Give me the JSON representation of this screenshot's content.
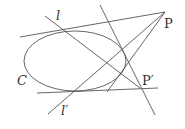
{
  "diagram": {
    "type": "projective-geometry-conic",
    "stroke_color": "#555555",
    "conic": {
      "label": "C",
      "cx": 75,
      "cy": 61,
      "rx": 51,
      "ry": 30
    },
    "points": [
      {
        "id": "P",
        "label": "P",
        "x": 165,
        "y": 12
      },
      {
        "id": "P_prime",
        "label": "P'",
        "x": 140,
        "y": 88
      }
    ],
    "lines": [
      {
        "id": "top-tangent",
        "x1": 20,
        "y1": 37,
        "x2": 165,
        "y2": 12
      },
      {
        "id": "bottom-tangent",
        "x1": 37,
        "y1": 93,
        "x2": 158,
        "y2": 88
      },
      {
        "id": "l",
        "label": "l",
        "x1": 45,
        "y1": 16,
        "x2": 140,
        "y2": 88
      },
      {
        "id": "l_prime",
        "label": "l'",
        "x1": 48,
        "y1": 114,
        "x2": 165,
        "y2": 12
      },
      {
        "id": "steep-line",
        "x1": 100,
        "y1": 5,
        "x2": 155,
        "y2": 115
      },
      {
        "id": "P-chord-line",
        "x1": 165,
        "y1": 12,
        "x2": 107,
        "y2": 92
      }
    ],
    "labels": {
      "l": "l",
      "l_prime": "l′",
      "C": "C",
      "P": "P",
      "P_prime": "P′"
    }
  }
}
